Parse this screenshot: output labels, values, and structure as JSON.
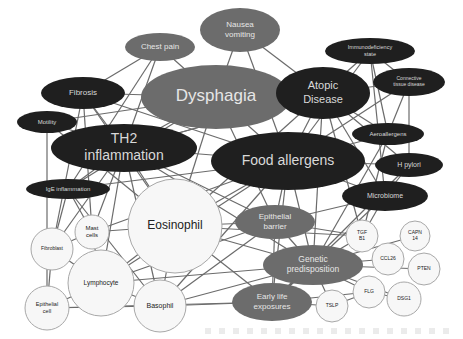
{
  "diagram": {
    "type": "network",
    "colors": {
      "dark": "#1f1f1f",
      "mid": "#6c6c6c",
      "light": "#f7f7f7",
      "edge": "#6b6b6b"
    },
    "nodes": [
      {
        "id": "chest_pain",
        "label": [
          "Chest pain"
        ],
        "style": "mid",
        "shape": "ellipse",
        "cx": 160,
        "cy": 47,
        "rx": 35,
        "ry": 14,
        "fs": 8
      },
      {
        "id": "nausea",
        "label": [
          "Nausea",
          "vomiting"
        ],
        "style": "mid",
        "shape": "ellipse",
        "cx": 240,
        "cy": 30,
        "rx": 40,
        "ry": 22,
        "fs": 8
      },
      {
        "id": "dysphagia",
        "label": [
          "Dysphagia"
        ],
        "style": "mid",
        "shape": "ellipse",
        "cx": 216,
        "cy": 97,
        "rx": 75,
        "ry": 32,
        "fs": 17
      },
      {
        "id": "fibrosis",
        "label": [
          "Fibrosis"
        ],
        "style": "dark",
        "shape": "ellipse",
        "cx": 83,
        "cy": 93,
        "rx": 42,
        "ry": 16,
        "fs": 8
      },
      {
        "id": "motility",
        "label": [
          "Motility"
        ],
        "style": "dark",
        "shape": "ellipse",
        "cx": 47,
        "cy": 122,
        "rx": 30,
        "ry": 11,
        "fs": 6
      },
      {
        "id": "th2",
        "label": [
          "TH2",
          "inflammation"
        ],
        "style": "dark",
        "shape": "ellipse",
        "cx": 124,
        "cy": 148,
        "rx": 73,
        "ry": 24,
        "fs": 14
      },
      {
        "id": "ige",
        "label": [
          "IgE inflammation"
        ],
        "style": "dark",
        "shape": "ellipse",
        "cx": 68,
        "cy": 189,
        "rx": 42,
        "ry": 10,
        "fs": 6
      },
      {
        "id": "atopic",
        "label": [
          "Atopic",
          "Disease"
        ],
        "style": "dark",
        "shape": "ellipse",
        "cx": 323,
        "cy": 93,
        "rx": 47,
        "ry": 26,
        "fs": 11
      },
      {
        "id": "immuno",
        "label": [
          "Immunodeficiency",
          "state"
        ],
        "style": "dark",
        "shape": "ellipse",
        "cx": 370,
        "cy": 51,
        "rx": 45,
        "ry": 13,
        "fs": 5.5
      },
      {
        "id": "connective",
        "label": [
          "Connective",
          "tissue disease"
        ],
        "style": "dark",
        "shape": "ellipse",
        "cx": 409,
        "cy": 82,
        "rx": 36,
        "ry": 14,
        "fs": 5
      },
      {
        "id": "aero",
        "label": [
          "Aeroallergens"
        ],
        "style": "dark",
        "shape": "ellipse",
        "cx": 388,
        "cy": 134,
        "rx": 36,
        "ry": 11,
        "fs": 6
      },
      {
        "id": "hpylori",
        "label": [
          "H pylori"
        ],
        "style": "dark",
        "shape": "ellipse",
        "cx": 409,
        "cy": 165,
        "rx": 34,
        "ry": 12,
        "fs": 7
      },
      {
        "id": "food",
        "label": [
          "Food allergens"
        ],
        "style": "dark",
        "shape": "ellipse",
        "cx": 288,
        "cy": 161,
        "rx": 77,
        "ry": 29,
        "fs": 14
      },
      {
        "id": "microbiome",
        "label": [
          "Microbiome"
        ],
        "style": "dark",
        "shape": "ellipse",
        "cx": 385,
        "cy": 196,
        "rx": 43,
        "ry": 15,
        "fs": 7
      },
      {
        "id": "eosinophil",
        "label": [
          "Eosinophil"
        ],
        "style": "light",
        "shape": "circle",
        "cx": 175,
        "cy": 226,
        "rx": 47,
        "ry": 47,
        "fs": 12
      },
      {
        "id": "mast",
        "label": [
          "Mast",
          "cells"
        ],
        "style": "light",
        "shape": "circle",
        "cx": 92,
        "cy": 232,
        "rx": 17,
        "ry": 17,
        "fs": 6
      },
      {
        "id": "fibroblast",
        "label": [
          "Fibroblast"
        ],
        "style": "light",
        "shape": "circle",
        "cx": 52,
        "cy": 249,
        "rx": 21,
        "ry": 21,
        "fs": 5
      },
      {
        "id": "lymphocyte",
        "label": [
          "Lymphocyte"
        ],
        "style": "light",
        "shape": "circle",
        "cx": 101,
        "cy": 283,
        "rx": 33,
        "ry": 33,
        "fs": 6.5
      },
      {
        "id": "epithelial_cell",
        "label": [
          "Epithelial",
          "cell"
        ],
        "style": "light",
        "shape": "circle",
        "cx": 47,
        "cy": 308,
        "rx": 22,
        "ry": 22,
        "fs": 5.5
      },
      {
        "id": "basophil",
        "label": [
          "Basophil"
        ],
        "style": "light",
        "shape": "circle",
        "cx": 160,
        "cy": 306,
        "rx": 26,
        "ry": 26,
        "fs": 7
      },
      {
        "id": "epi_barrier",
        "label": [
          "Epithelial",
          "barrier"
        ],
        "style": "mid",
        "shape": "ellipse",
        "cx": 275,
        "cy": 222,
        "rx": 40,
        "ry": 17,
        "fs": 8
      },
      {
        "id": "genetic",
        "label": [
          "Genetic",
          "predisposition"
        ],
        "style": "mid",
        "shape": "ellipse",
        "cx": 313,
        "cy": 265,
        "rx": 50,
        "ry": 20,
        "fs": 8.5
      },
      {
        "id": "early",
        "label": [
          "Early life",
          "exposures"
        ],
        "style": "mid",
        "shape": "ellipse",
        "cx": 272,
        "cy": 302,
        "rx": 40,
        "ry": 19,
        "fs": 8
      },
      {
        "id": "tgfb1",
        "label": [
          "TGF",
          "B1"
        ],
        "style": "light",
        "shape": "circle",
        "cx": 362,
        "cy": 236,
        "rx": 16,
        "ry": 16,
        "fs": 5
      },
      {
        "id": "capn14",
        "label": [
          "CAPN",
          "14"
        ],
        "style": "light",
        "shape": "circle",
        "cx": 415,
        "cy": 236,
        "rx": 15,
        "ry": 15,
        "fs": 5
      },
      {
        "id": "ccl26",
        "label": [
          "CCL26"
        ],
        "style": "light",
        "shape": "circle",
        "cx": 388,
        "cy": 259,
        "rx": 16,
        "ry": 16,
        "fs": 5
      },
      {
        "id": "pten",
        "label": [
          "PTEN"
        ],
        "style": "light",
        "shape": "circle",
        "cx": 424,
        "cy": 269,
        "rx": 16,
        "ry": 16,
        "fs": 5
      },
      {
        "id": "flg",
        "label": [
          "FLG"
        ],
        "style": "light",
        "shape": "circle",
        "cx": 369,
        "cy": 292,
        "rx": 16,
        "ry": 16,
        "fs": 5
      },
      {
        "id": "dsg1",
        "label": [
          "DSG1"
        ],
        "style": "light",
        "shape": "circle",
        "cx": 404,
        "cy": 299,
        "rx": 17,
        "ry": 17,
        "fs": 5
      },
      {
        "id": "tslp",
        "label": [
          "TSLP"
        ],
        "style": "light",
        "shape": "circle",
        "cx": 332,
        "cy": 306,
        "rx": 16,
        "ry": 16,
        "fs": 5
      }
    ],
    "edges": [
      [
        "chest_pain",
        "fibrosis"
      ],
      [
        "chest_pain",
        "th2"
      ],
      [
        "chest_pain",
        "dysphagia"
      ],
      [
        "chest_pain",
        "ige"
      ],
      [
        "nausea",
        "dysphagia"
      ],
      [
        "nausea",
        "food"
      ],
      [
        "nausea",
        "atopic"
      ],
      [
        "dysphagia",
        "fibrosis"
      ],
      [
        "dysphagia",
        "th2"
      ],
      [
        "dysphagia",
        "atopic"
      ],
      [
        "dysphagia",
        "food"
      ],
      [
        "dysphagia",
        "eosinophil"
      ],
      [
        "dysphagia",
        "motility"
      ],
      [
        "dysphagia",
        "ige"
      ],
      [
        "dysphagia",
        "epi_barrier"
      ],
      [
        "fibrosis",
        "th2"
      ],
      [
        "fibrosis",
        "eosinophil"
      ],
      [
        "fibrosis",
        "fibroblast"
      ],
      [
        "fibrosis",
        "food"
      ],
      [
        "fibrosis",
        "mast"
      ],
      [
        "motility",
        "th2"
      ],
      [
        "motility",
        "epithelial_cell"
      ],
      [
        "motility",
        "eosinophil"
      ],
      [
        "th2",
        "ige"
      ],
      [
        "th2",
        "food"
      ],
      [
        "th2",
        "eosinophil"
      ],
      [
        "th2",
        "mast"
      ],
      [
        "th2",
        "lymphocyte"
      ],
      [
        "th2",
        "basophil"
      ],
      [
        "th2",
        "atopic"
      ],
      [
        "th2",
        "epi_barrier"
      ],
      [
        "th2",
        "genetic"
      ],
      [
        "th2",
        "fibroblast"
      ],
      [
        "ige",
        "mast"
      ],
      [
        "ige",
        "basophil"
      ],
      [
        "ige",
        "food"
      ],
      [
        "ige",
        "fibroblast"
      ],
      [
        "atopic",
        "immuno"
      ],
      [
        "atopic",
        "connective"
      ],
      [
        "atopic",
        "aero"
      ],
      [
        "atopic",
        "food"
      ],
      [
        "atopic",
        "hpylori"
      ],
      [
        "atopic",
        "microbiome"
      ],
      [
        "atopic",
        "genetic"
      ],
      [
        "atopic",
        "eosinophil"
      ],
      [
        "atopic",
        "th2"
      ],
      [
        "atopic",
        "tgfb1"
      ],
      [
        "immuno",
        "connective"
      ],
      [
        "immuno",
        "aero"
      ],
      [
        "immuno",
        "food"
      ],
      [
        "immuno",
        "microbiome"
      ],
      [
        "connective",
        "aero"
      ],
      [
        "connective",
        "hpylori"
      ],
      [
        "connective",
        "food"
      ],
      [
        "aero",
        "food"
      ],
      [
        "aero",
        "genetic"
      ],
      [
        "aero",
        "tgfb1"
      ],
      [
        "hpylori",
        "food"
      ],
      [
        "hpylori",
        "microbiome"
      ],
      [
        "hpylori",
        "early"
      ],
      [
        "food",
        "eosinophil"
      ],
      [
        "food",
        "epi_barrier"
      ],
      [
        "food",
        "genetic"
      ],
      [
        "food",
        "early"
      ],
      [
        "food",
        "microbiome"
      ],
      [
        "food",
        "basophil"
      ],
      [
        "food",
        "lymphocyte"
      ],
      [
        "food",
        "mast"
      ],
      [
        "microbiome",
        "early"
      ],
      [
        "microbiome",
        "tgfb1"
      ],
      [
        "microbiome",
        "epi_barrier"
      ],
      [
        "eosinophil",
        "mast"
      ],
      [
        "eosinophil",
        "lymphocyte"
      ],
      [
        "eosinophil",
        "basophil"
      ],
      [
        "eosinophil",
        "epi_barrier"
      ],
      [
        "eosinophil",
        "genetic"
      ],
      [
        "eosinophil",
        "early"
      ],
      [
        "eosinophil",
        "tgfb1"
      ],
      [
        "mast",
        "lymphocyte"
      ],
      [
        "mast",
        "fibroblast"
      ],
      [
        "fibroblast",
        "lymphocyte"
      ],
      [
        "fibroblast",
        "epithelial_cell"
      ],
      [
        "lymphocyte",
        "epithelial_cell"
      ],
      [
        "lymphocyte",
        "basophil"
      ],
      [
        "lymphocyte",
        "genetic"
      ],
      [
        "lymphocyte",
        "epi_barrier"
      ],
      [
        "epithelial_cell",
        "basophil"
      ],
      [
        "epithelial_cell",
        "early"
      ],
      [
        "basophil",
        "early"
      ],
      [
        "basophil",
        "genetic"
      ],
      [
        "basophil",
        "epi_barrier"
      ],
      [
        "epi_barrier",
        "genetic"
      ],
      [
        "epi_barrier",
        "tgfb1"
      ],
      [
        "epi_barrier",
        "early"
      ],
      [
        "genetic",
        "tgfb1"
      ],
      [
        "genetic",
        "capn14"
      ],
      [
        "genetic",
        "ccl26"
      ],
      [
        "genetic",
        "pten"
      ],
      [
        "genetic",
        "flg"
      ],
      [
        "genetic",
        "dsg1"
      ],
      [
        "genetic",
        "tslp"
      ],
      [
        "genetic",
        "early"
      ],
      [
        "early",
        "tslp"
      ],
      [
        "early",
        "flg"
      ],
      [
        "tslp",
        "flg"
      ],
      [
        "flg",
        "dsg1"
      ]
    ]
  }
}
